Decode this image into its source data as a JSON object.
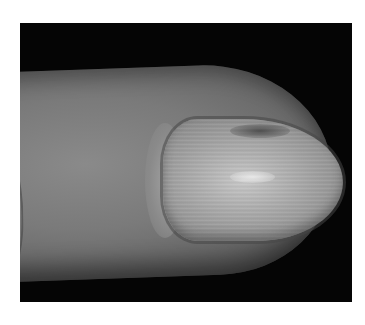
{
  "image": {
    "subject": "fingernail close-up photograph",
    "colors": {
      "border": "#ffffff",
      "background": "#050505",
      "skin": "#7a7a7a",
      "nail": "#adadad"
    }
  }
}
